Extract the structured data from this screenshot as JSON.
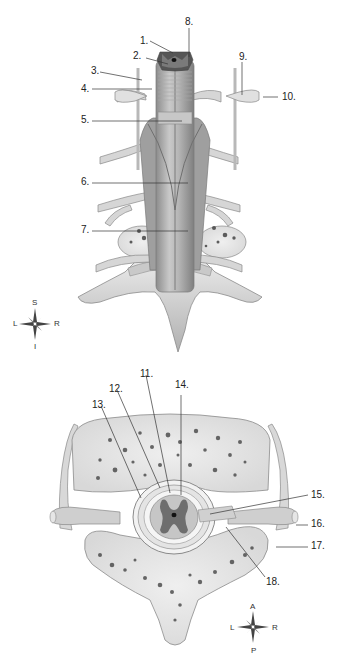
{
  "figure": {
    "top_view": {
      "description": "Posterior view of spinal cord within vertebral column, dura opened",
      "labels": [
        {
          "id": "1",
          "text": "1.",
          "x": 140,
          "y": 36
        },
        {
          "id": "2",
          "text": "2.",
          "x": 133,
          "y": 51
        },
        {
          "id": "3",
          "text": "3.",
          "x": 91,
          "y": 66
        },
        {
          "id": "4",
          "text": "4.",
          "x": 81,
          "y": 84
        },
        {
          "id": "5",
          "text": "5.",
          "x": 81,
          "y": 115
        },
        {
          "id": "6",
          "text": "6.",
          "x": 81,
          "y": 177
        },
        {
          "id": "7",
          "text": "7.",
          "x": 81,
          "y": 225
        },
        {
          "id": "8",
          "text": "8.",
          "x": 185,
          "y": 17
        },
        {
          "id": "9",
          "text": "9.",
          "x": 239,
          "y": 52
        },
        {
          "id": "10",
          "text": "10.",
          "x": 282,
          "y": 92
        }
      ],
      "compass": {
        "top": "S",
        "left": "L",
        "right": "R",
        "bottom": "I"
      }
    },
    "bottom_view": {
      "description": "Transverse section of vertebra with spinal cord and meninges",
      "labels": [
        {
          "id": "11",
          "text": "11.",
          "x": 140,
          "y": 369
        },
        {
          "id": "12",
          "text": "12.",
          "x": 109,
          "y": 384
        },
        {
          "id": "13",
          "text": "13.",
          "x": 92,
          "y": 400
        },
        {
          "id": "14",
          "text": "14.",
          "x": 175,
          "y": 380
        },
        {
          "id": "15",
          "text": "15.",
          "x": 311,
          "y": 490
        },
        {
          "id": "16",
          "text": "16.",
          "x": 311,
          "y": 519
        },
        {
          "id": "17",
          "text": "17.",
          "x": 311,
          "y": 541
        },
        {
          "id": "18",
          "text": "18.",
          "x": 266,
          "y": 577
        }
      ],
      "compass": {
        "top": "A",
        "left": "L",
        "right": "R",
        "bottom": "P"
      }
    },
    "colors": {
      "bone": "#dcdcdc",
      "bone_shadow": "#9a9a9a",
      "cord": "#bdbdbd",
      "gray_matter": "#6e6e6e",
      "outline": "#8a8a8a",
      "label_text": "#222222",
      "leader_line": "#333333"
    }
  }
}
